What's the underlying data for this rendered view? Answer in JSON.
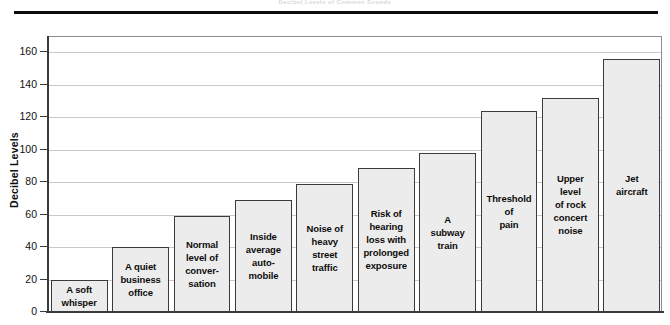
{
  "caption": {
    "top_text": "Decibel Levels of Common Sounds"
  },
  "chart_data": {
    "type": "bar",
    "title": "",
    "xlabel": "",
    "ylabel": "Decibel Levels",
    "ylim": [
      0,
      170
    ],
    "yticks": [
      0,
      20,
      40,
      60,
      80,
      100,
      120,
      140,
      160
    ],
    "ytick_labels": [
      "0",
      "20",
      "40",
      "60",
      "80",
      "100",
      "120",
      "140",
      "160"
    ],
    "grid": true,
    "legend": "none",
    "bar_fill_color": "#ececec",
    "bar_border_color": "#3b3b3b",
    "categories": [
      "A soft\nwhisper",
      "A quiet\nbusiness\noffice",
      "Normal\nlevel of\nconver-\nsation",
      "Inside\naverage\nauto-\nmobile",
      "Noise of\nheavy\nstreet\ntraffic",
      "Risk of\nhearing\nloss with\nprolonged\nexposure",
      "A\nsubway\ntrain",
      "Threshold\nof\npain",
      "Upper\nlevel\nof rock\nconcert\nnoise",
      "Jet\naircraft"
    ],
    "values": [
      20,
      40,
      59,
      69,
      79,
      89,
      98,
      124,
      132,
      156
    ]
  }
}
